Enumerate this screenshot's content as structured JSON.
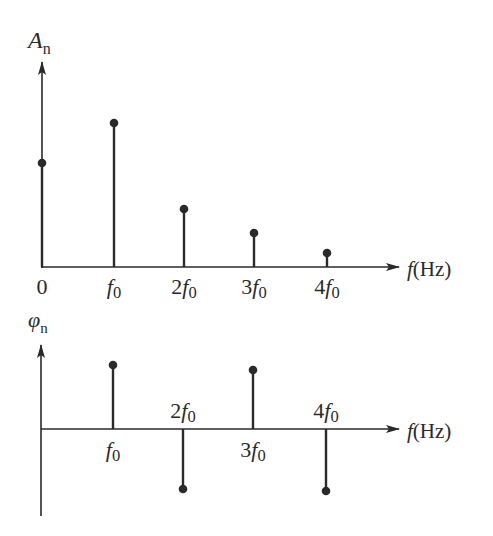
{
  "chart_data": [
    {
      "type": "stem",
      "title": "Amplitude spectrum",
      "ylabel": "A",
      "ylabel_sub": "n",
      "xlabel": "f(Hz)",
      "categories": [
        "0",
        "f0",
        "2f0",
        "3f0",
        "4f0"
      ],
      "tick_labels": [
        {
          "coef": "0",
          "sym": "",
          "sub": ""
        },
        {
          "coef": "",
          "sym": "f",
          "sub": "0"
        },
        {
          "coef": "2",
          "sym": "f",
          "sub": "0"
        },
        {
          "coef": "3",
          "sym": "f",
          "sub": "0"
        },
        {
          "coef": "4",
          "sym": "f",
          "sub": "0"
        }
      ],
      "values": [
        0.52,
        0.72,
        0.29,
        0.17,
        0.07
      ],
      "ylim": [
        0,
        1
      ],
      "grid": false
    },
    {
      "type": "stem",
      "title": "Phase spectrum",
      "ylabel": "φ",
      "ylabel_sub": "n",
      "xlabel": "f(Hz)",
      "categories": [
        "f0",
        "2f0",
        "3f0",
        "4f0"
      ],
      "tick_labels": [
        {
          "coef": "",
          "sym": "f",
          "sub": "0",
          "position": "below"
        },
        {
          "coef": "2",
          "sym": "f",
          "sub": "0",
          "position": "above"
        },
        {
          "coef": "3",
          "sym": "f",
          "sub": "0",
          "position": "below"
        },
        {
          "coef": "4",
          "sym": "f",
          "sub": "0",
          "position": "above"
        }
      ],
      "values": [
        0.64,
        -0.6,
        0.59,
        -0.62
      ],
      "ylim": [
        -1,
        1
      ],
      "grid": false
    }
  ],
  "colors": {
    "ink": "#2a2a2a",
    "background": "#ffffff"
  }
}
